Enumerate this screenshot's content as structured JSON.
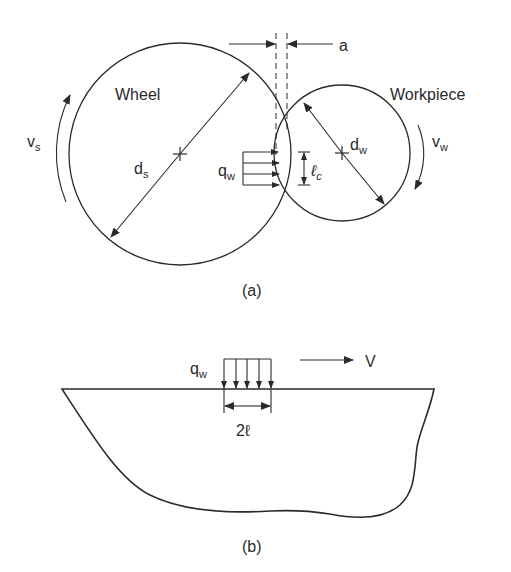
{
  "figure_a": {
    "caption": "(a)",
    "wheel_label": "Wheel",
    "workpiece_label": "Workpiece",
    "wheel_diameter": {
      "main": "d",
      "sub": "s"
    },
    "workpiece_diameter": {
      "main": "d",
      "sub": "w"
    },
    "wheel_speed": {
      "main": "v",
      "sub": "s"
    },
    "workpiece_speed": {
      "main": "v",
      "sub": "w"
    },
    "heat_flux": {
      "main": "q",
      "sub": "w"
    },
    "contact_length": {
      "main": "ℓ",
      "sub": "c"
    },
    "depth_of_cut": "a"
  },
  "figure_b": {
    "caption": "(b)",
    "heat_flux": {
      "main": "q",
      "sub": "w"
    },
    "velocity": "V",
    "source_width": "2ℓ"
  },
  "colors": {
    "line": "#2a2a2a",
    "background": "#ffffff"
  }
}
